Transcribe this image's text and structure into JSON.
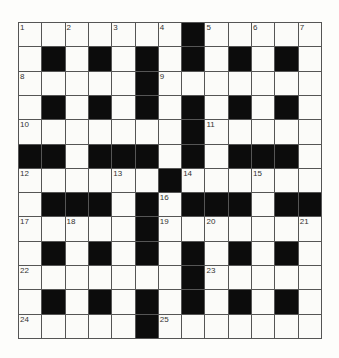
{
  "puzzle": {
    "rows": 13,
    "cols": 13,
    "colors": {
      "black": "#0c0c0c",
      "white": "#fbfbf9",
      "line": "#555555"
    },
    "layout": [
      "WWWWWWWBWWWWW",
      "WBWBWBWBWBWBW",
      "WWWWWBWWWWWWW",
      "WBWBWBWBWBWBW",
      "WWWWWWWBWWWWW",
      "BBWBBBWBWBBBW",
      "WWWWWWBWWWWWW",
      "WBBBWBWBBBWBB",
      "WWWWWBWWWWWWW",
      "WBWBWBWBWBWBW",
      "WWWWWWWBWWWWW",
      "WBWBWBWBWBWBW",
      "WWWWWBWWWWWWW"
    ],
    "numbers": [
      {
        "n": "1",
        "r": 0,
        "c": 0
      },
      {
        "n": "2",
        "r": 0,
        "c": 2
      },
      {
        "n": "3",
        "r": 0,
        "c": 4
      },
      {
        "n": "4",
        "r": 0,
        "c": 6
      },
      {
        "n": "5",
        "r": 0,
        "c": 8
      },
      {
        "n": "6",
        "r": 0,
        "c": 10
      },
      {
        "n": "7",
        "r": 0,
        "c": 12
      },
      {
        "n": "8",
        "r": 2,
        "c": 0
      },
      {
        "n": "9",
        "r": 2,
        "c": 6
      },
      {
        "n": "10",
        "r": 4,
        "c": 0
      },
      {
        "n": "11",
        "r": 4,
        "c": 8
      },
      {
        "n": "12",
        "r": 6,
        "c": 0
      },
      {
        "n": "13",
        "r": 6,
        "c": 4
      },
      {
        "n": "14",
        "r": 6,
        "c": 7
      },
      {
        "n": "15",
        "r": 6,
        "c": 10
      },
      {
        "n": "16",
        "r": 7,
        "c": 6
      },
      {
        "n": "17",
        "r": 8,
        "c": 0
      },
      {
        "n": "18",
        "r": 8,
        "c": 2
      },
      {
        "n": "19",
        "r": 8,
        "c": 6
      },
      {
        "n": "20",
        "r": 8,
        "c": 8
      },
      {
        "n": "21",
        "r": 8,
        "c": 12
      },
      {
        "n": "22",
        "r": 10,
        "c": 0
      },
      {
        "n": "23",
        "r": 10,
        "c": 8
      },
      {
        "n": "24",
        "r": 12,
        "c": 0
      },
      {
        "n": "25",
        "r": 12,
        "c": 6
      }
    ]
  }
}
